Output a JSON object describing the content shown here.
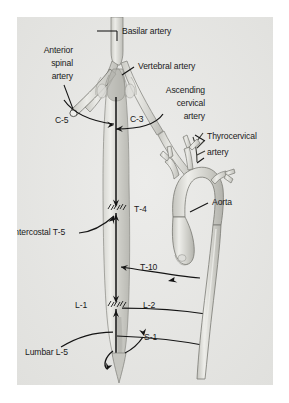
{
  "figure": {
    "background_color": "#ffffff",
    "plate_color": "#e8e8e6",
    "ink_color": "#1a1a1a",
    "vessel_fill": "#cfcfca",
    "vessel_stroke": "#6e6e68"
  },
  "labels": {
    "basilar_artery": "Basilar artery",
    "anterior_spinal_artery": "Anterior\nspinal\nartery",
    "anterior_spinal_artery_l1": "Anterior",
    "anterior_spinal_artery_l2": "spinal",
    "anterior_spinal_artery_l3": "artery",
    "vertebral_artery": "Vertebral artery",
    "ascending_cervical_artery_l1": "Ascending",
    "ascending_cervical_artery_l2": "cervical",
    "ascending_cervical_artery_l3": "artery",
    "thyrocervical_artery_l1": "Thyrocervical",
    "thyrocervical_artery_l2": "artery",
    "aorta": "Aorta",
    "c5": "C‑5",
    "c3": "C‑3",
    "t4": "T‑4",
    "intercostal_t5": "Intercostal T‑5",
    "t10": "T‑10",
    "l1": "L‑1",
    "l2": "L‑2",
    "s1": "S‑1",
    "lumbar_l5": "Lumbar L‑5"
  },
  "structures": [
    {
      "name": "basilar-artery",
      "kind": "vessel",
      "level": "brainstem"
    },
    {
      "name": "vertebral-artery-left",
      "kind": "vessel",
      "level": "cervical"
    },
    {
      "name": "vertebral-artery-right",
      "kind": "vessel",
      "level": "cervical"
    },
    {
      "name": "anterior-spinal-artery",
      "kind": "vessel",
      "level": "cervical-to-lumbar"
    },
    {
      "name": "spinal-cord",
      "kind": "cord",
      "level": "C1-L5"
    },
    {
      "name": "ascending-cervical-artery",
      "kind": "vessel",
      "level": "cervical"
    },
    {
      "name": "thyrocervical-trunk",
      "kind": "vessel",
      "level": "cervical"
    },
    {
      "name": "aortic-arch",
      "kind": "vessel",
      "level": "thoracic"
    },
    {
      "name": "descending-aorta",
      "kind": "vessel",
      "level": "thoracic-lumbar"
    }
  ],
  "segmental_feeders": [
    {
      "name": "c3-radicular",
      "label": "C‑3",
      "side": "right"
    },
    {
      "name": "c5-radicular",
      "label": "C‑5",
      "side": "left"
    },
    {
      "name": "t4-watershed",
      "label": "T‑4",
      "side": "right"
    },
    {
      "name": "intercostal-t5-feeder",
      "label": "Intercostal T‑5",
      "side": "left"
    },
    {
      "name": "t10-feeder",
      "label": "T‑10",
      "side": "right"
    },
    {
      "name": "l1-watershed",
      "label": "L‑1",
      "side": "left"
    },
    {
      "name": "l2-feeder",
      "label": "L‑2",
      "side": "right"
    },
    {
      "name": "s1-feeder",
      "label": "S‑1",
      "side": "right"
    },
    {
      "name": "lumbar-l5-feeder",
      "label": "Lumbar L‑5",
      "side": "left"
    }
  ]
}
